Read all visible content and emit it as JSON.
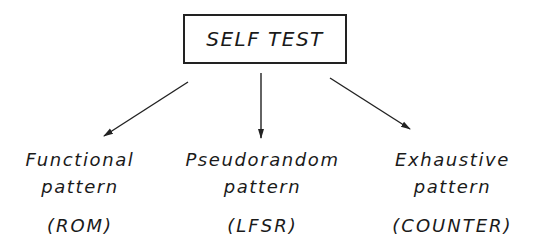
{
  "diagram": {
    "root": {
      "label": "SELF TEST"
    },
    "children": [
      {
        "line1": "Functional",
        "line2": "pattern",
        "line3": "(ROM)"
      },
      {
        "line1": "Pseudorandom",
        "line2": "pattern",
        "line3": "(LFSR)"
      },
      {
        "line1": "Exhaustive",
        "line2": "pattern",
        "line3": "(COUNTER)"
      }
    ],
    "edges": [
      {
        "from": "SELF TEST",
        "to": "Functional pattern (ROM)"
      },
      {
        "from": "SELF TEST",
        "to": "Pseudorandom pattern (LFSR)"
      },
      {
        "from": "SELF TEST",
        "to": "Exhaustive pattern (COUNTER)"
      }
    ],
    "colors": {
      "line": "#222222",
      "background": "#ffffff"
    }
  }
}
